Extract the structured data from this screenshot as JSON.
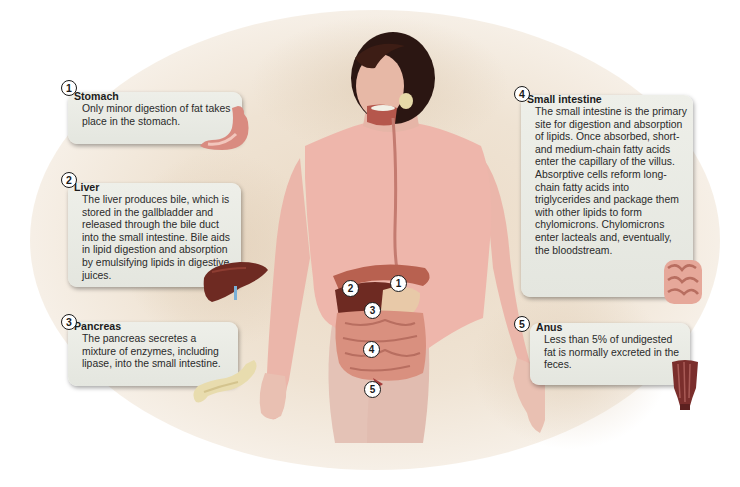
{
  "diagram": {
    "figure_markers": [
      "1",
      "2",
      "3",
      "4",
      "5"
    ],
    "callouts": [
      {
        "number": "1",
        "title": "Stomach",
        "text": "Only minor digestion of fat takes place in the stomach.",
        "icon": "stomach-icon"
      },
      {
        "number": "2",
        "title": "Liver",
        "text": "The liver produces bile, which is stored in the gallbladder and released through the bile duct into the small intestine. Bile aids in lipid digestion and absorption by emulsifying lipids in digestive juices.",
        "icon": "liver-icon"
      },
      {
        "number": "3",
        "title": "Pancreas",
        "text": "The pancreas secretes a mixture of enzymes, including lipase, into the small intestine.",
        "icon": "pancreas-icon"
      },
      {
        "number": "4",
        "title": "Small intestine",
        "text": "The small intestine is the primary site for digestion and absorption of lipids. Once absorbed, short- and medium-chain fatty acids enter the capillary of the villus. Absorptive cells reform long-chain fatty acids into triglycerides and package them with other lipids to form chylomicrons. Chylomicrons enter lacteals and, eventually, the bloodstream.",
        "icon": "small-intestine-icon"
      },
      {
        "number": "5",
        "title": "Anus",
        "text": "Less than 5% of undigested fat is normally excreted in the feces.",
        "icon": "anus-icon"
      }
    ]
  },
  "colors": {
    "callout_bg": "#e9ebe4",
    "skin": "#ebb3a8",
    "hair": "#2b1612",
    "organ_red": "#a8574c",
    "intestine": "#d99082",
    "liver": "#6e2a22",
    "pancreas": "#e8dcae",
    "background_beige": "#ecdcc8"
  }
}
